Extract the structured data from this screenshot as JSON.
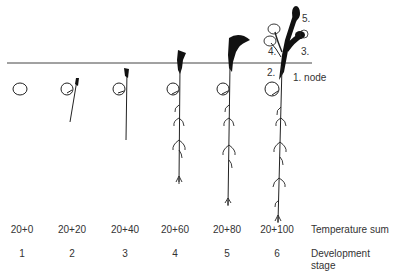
{
  "diagram": {
    "type": "plant-development-stages",
    "soil_line": true,
    "stages": [
      {
        "temperature_sum": "20+0",
        "stage": "1"
      },
      {
        "temperature_sum": "20+20",
        "stage": "2"
      },
      {
        "temperature_sum": "20+40",
        "stage": "3"
      },
      {
        "temperature_sum": "20+60",
        "stage": "4"
      },
      {
        "temperature_sum": "20+80",
        "stage": "5"
      },
      {
        "temperature_sum": "20+100",
        "stage": "6"
      }
    ],
    "row_labels": {
      "temperature_sum": "Temperature sum",
      "development_stage_line1": "Development",
      "development_stage_line2": "stage"
    },
    "annotations": {
      "node1": "1. node",
      "node2": "2.",
      "node3": "3.",
      "node4": "4.",
      "node5": "5."
    }
  }
}
